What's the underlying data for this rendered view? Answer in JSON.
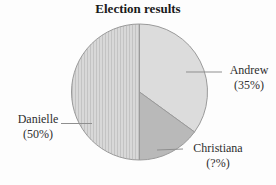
{
  "chart_data": {
    "type": "pie",
    "title": "Election results",
    "start_angle_deg": 0,
    "direction": "clockwise",
    "slices": [
      {
        "label": "Andrew",
        "percent_label": "(35%)",
        "value": 35,
        "fill": "#dcdcdc",
        "pattern": "solid"
      },
      {
        "label": "Christiana",
        "percent_label": "(?%)",
        "value": 15,
        "fill": "#b9b9b9",
        "pattern": "solid"
      },
      {
        "label": "Danielle",
        "percent_label": "(50%)",
        "value": 50,
        "fill": "#d8d8d8",
        "pattern": "vertical-stripes",
        "pattern_line_color": "#c3c3c3"
      }
    ],
    "stroke_color": "#9a9a9a",
    "leader_line_color": "#8f8f8f",
    "label_text_color": "#2e2e2e",
    "title_color": "#1a1a1a",
    "legend": "none",
    "labels_outside_with_leader_lines": true
  }
}
